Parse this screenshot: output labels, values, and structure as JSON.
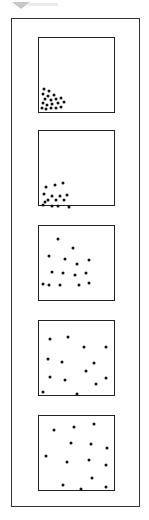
{
  "title": "",
  "panels": [
    {
      "label": "panel-1",
      "top": 37,
      "dots": [
        [
          4,
          50
        ],
        [
          9,
          52
        ],
        [
          3,
          55
        ],
        [
          8,
          57
        ],
        [
          14,
          56
        ],
        [
          5,
          60
        ],
        [
          11,
          61
        ],
        [
          16,
          60
        ],
        [
          21,
          59
        ],
        [
          3,
          64
        ],
        [
          7,
          66
        ],
        [
          12,
          65
        ],
        [
          18,
          64
        ],
        [
          24,
          63
        ],
        [
          2,
          69
        ],
        [
          6,
          70
        ],
        [
          11,
          69
        ],
        [
          16,
          69
        ],
        [
          21,
          68
        ]
      ]
    },
    {
      "label": "panel-2",
      "top": 130,
      "dots": [
        [
          6,
          55
        ],
        [
          15,
          53
        ],
        [
          23,
          51
        ],
        [
          4,
          62
        ],
        [
          12,
          64
        ],
        [
          20,
          64
        ],
        [
          27,
          63
        ],
        [
          8,
          68
        ],
        [
          16,
          68
        ],
        [
          24,
          68
        ],
        [
          3,
          73
        ],
        [
          12,
          74
        ],
        [
          18,
          74
        ],
        [
          29,
          75
        ],
        [
          5,
          70
        ]
      ]
    },
    {
      "label": "panel-3",
      "top": 225,
      "dots": [
        [
          18,
          12
        ],
        [
          33,
          21
        ],
        [
          9,
          29
        ],
        [
          25,
          32
        ],
        [
          37,
          37
        ],
        [
          49,
          33
        ],
        [
          12,
          45
        ],
        [
          23,
          46
        ],
        [
          35,
          48
        ],
        [
          46,
          46
        ],
        [
          3,
          57
        ],
        [
          9,
          58
        ],
        [
          20,
          58
        ],
        [
          39,
          58
        ],
        [
          49,
          56
        ]
      ]
    },
    {
      "label": "panel-4",
      "top": 320,
      "dots": [
        [
          10,
          17
        ],
        [
          28,
          15
        ],
        [
          44,
          25
        ],
        [
          66,
          25
        ],
        [
          8,
          37
        ],
        [
          22,
          40
        ],
        [
          54,
          41
        ],
        [
          46,
          49
        ],
        [
          10,
          55
        ],
        [
          25,
          58
        ],
        [
          66,
          56
        ],
        [
          56,
          62
        ],
        [
          3,
          70
        ],
        [
          37,
          72
        ],
        [
          57,
          5
        ]
      ]
    },
    {
      "label": "panel-5",
      "top": 415,
      "dots": [
        [
          14,
          13
        ],
        [
          34,
          10
        ],
        [
          54,
          7
        ],
        [
          31,
          26
        ],
        [
          51,
          27
        ],
        [
          67,
          31
        ],
        [
          6,
          39
        ],
        [
          27,
          45
        ],
        [
          49,
          43
        ],
        [
          66,
          48
        ],
        [
          52,
          61
        ],
        [
          23,
          68
        ],
        [
          41,
          72
        ],
        [
          66,
          70
        ],
        [
          3,
          3
        ]
      ]
    }
  ]
}
